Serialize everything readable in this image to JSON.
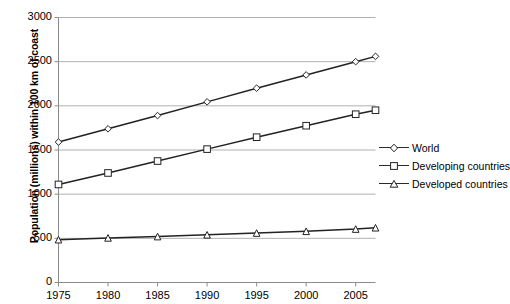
{
  "chart_data": {
    "type": "line",
    "title": "",
    "xlabel": "",
    "ylabel": "Population (millions)  within 100 km of coast",
    "x": [
      1975,
      1980,
      1985,
      1990,
      1995,
      2000,
      2005,
      2007
    ],
    "xlim": [
      1975,
      2007
    ],
    "ylim": [
      0,
      3000
    ],
    "xticks": [
      "1975",
      "1980",
      "1985",
      "1990",
      "1995",
      "2000",
      "2005"
    ],
    "xtick_values": [
      1975,
      1980,
      1985,
      1990,
      1995,
      2000,
      2005
    ],
    "yticks": [
      "0",
      "500",
      "1000",
      "1500",
      "2000",
      "2500",
      "3000"
    ],
    "ytick_values": [
      0,
      500,
      1000,
      1500,
      2000,
      2500,
      3000
    ],
    "grid": "horizontal",
    "legend_position": "right",
    "series": [
      {
        "name": "World",
        "marker": "diamond",
        "color": "#222222",
        "values": [
          1590,
          1740,
          1890,
          2045,
          2200,
          2350,
          2500,
          2560
        ]
      },
      {
        "name": "Developing countries",
        "marker": "square",
        "color": "#222222",
        "values": [
          1110,
          1240,
          1375,
          1510,
          1645,
          1775,
          1905,
          1950
        ]
      },
      {
        "name": "Developed countries",
        "marker": "triangle",
        "color": "#222222",
        "values": [
          485,
          505,
          520,
          540,
          560,
          580,
          605,
          620
        ]
      }
    ]
  },
  "axis": {
    "y_title": "Population (millions)  within 100 km of coast"
  },
  "legend": {
    "items": [
      {
        "label": "World"
      },
      {
        "label": "Developing countries"
      },
      {
        "label": "Developed countries"
      }
    ]
  },
  "colors": {
    "line": "#222222",
    "gridline": "#b0b0b0",
    "axis": "#8c8c8c",
    "marker_fill": "#ffffff",
    "text": "#000000"
  }
}
